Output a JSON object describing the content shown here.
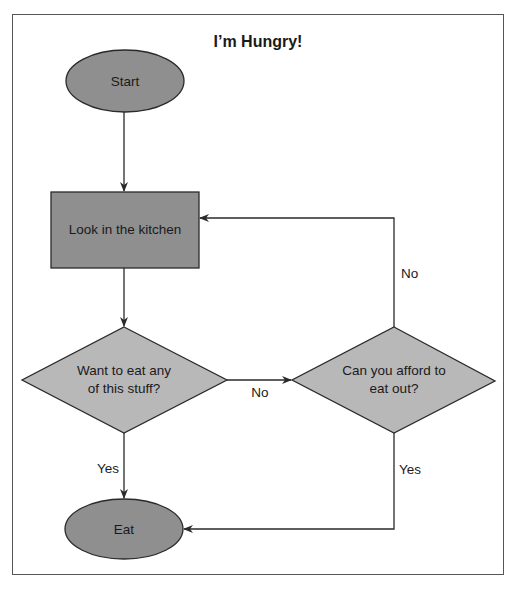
{
  "title": "I’m Hungry!",
  "colors": {
    "terminal_fill": "#8f8f8f",
    "process_fill": "#8f8f8f",
    "decision_fill": "#b8b8b8",
    "stroke": "#2a2a2a"
  },
  "nodes": {
    "start": {
      "type": "terminal",
      "label": "Start"
    },
    "kitchen": {
      "type": "process",
      "label": "Look in the kitchen"
    },
    "want": {
      "type": "decision",
      "lines": [
        "Want to eat any",
        "of this stuff?"
      ]
    },
    "afford": {
      "type": "decision",
      "lines": [
        "Can you afford to",
        "eat out?"
      ]
    },
    "eat": {
      "type": "terminal",
      "label": "Eat"
    }
  },
  "edges": [
    {
      "from": "start",
      "to": "kitchen",
      "label": ""
    },
    {
      "from": "kitchen",
      "to": "want",
      "label": ""
    },
    {
      "from": "want",
      "to": "afford",
      "label": "No"
    },
    {
      "from": "afford",
      "to": "kitchen",
      "label": "No"
    },
    {
      "from": "want",
      "to": "eat",
      "label": "Yes"
    },
    {
      "from": "afford",
      "to": "eat",
      "label": "Yes"
    }
  ]
}
